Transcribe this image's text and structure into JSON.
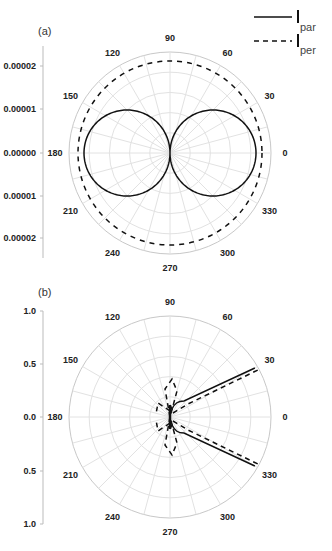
{
  "figure": {
    "legend": [
      {
        "label": "par",
        "style": "solid"
      },
      {
        "label": "per",
        "style": "dashed"
      }
    ]
  },
  "chart_data": [
    {
      "type": "polar-line",
      "panel_label": "(a)",
      "angle_ticks": [
        "0",
        "30",
        "60",
        "90",
        "120",
        "150",
        "180",
        "210",
        "240",
        "270",
        "300",
        "330"
      ],
      "radial_axis": {
        "tick_labels": [
          "0.00002",
          "0.00001",
          "0.00000",
          "0.00001",
          "0.00002"
        ],
        "max": 2.35e-05
      },
      "grid": true,
      "series": [
        {
          "name": "par",
          "style": "solid",
          "shape": "figure-eight dipole lobes along 0-180",
          "r_of_theta": "0.0000200*|cos(theta)|",
          "max_value": 2e-05
        },
        {
          "name": "per",
          "style": "dashed",
          "shape": "near-circle",
          "r_of_theta": "0.0000214 (constant)",
          "value": 2.14e-05
        }
      ]
    },
    {
      "type": "polar-line",
      "panel_label": "(b)",
      "angle_ticks": [
        "0",
        "30",
        "60",
        "90",
        "120",
        "150",
        "180",
        "210",
        "240",
        "270",
        "300",
        "330"
      ],
      "radial_axis": {
        "tick_labels": [
          "1.0",
          "0.5",
          "0.0",
          "0.5",
          "1.0"
        ],
        "max": 0.95
      },
      "grid": true,
      "series": [
        {
          "name": "par",
          "style": "solid",
          "shape": "two narrow rays toward ~30 and ~330 degrees",
          "ray_angles_deg": [
            30,
            330
          ],
          "ray_length": 0.93
        },
        {
          "name": "per",
          "style": "dashed",
          "shape": "rays toward ~30 and ~330 plus small lobes near 80/100 and 260/280",
          "ray_angles_deg": [
            30,
            330
          ],
          "ray_length": 0.93,
          "small_lobe_length": 0.2
        }
      ]
    }
  ]
}
